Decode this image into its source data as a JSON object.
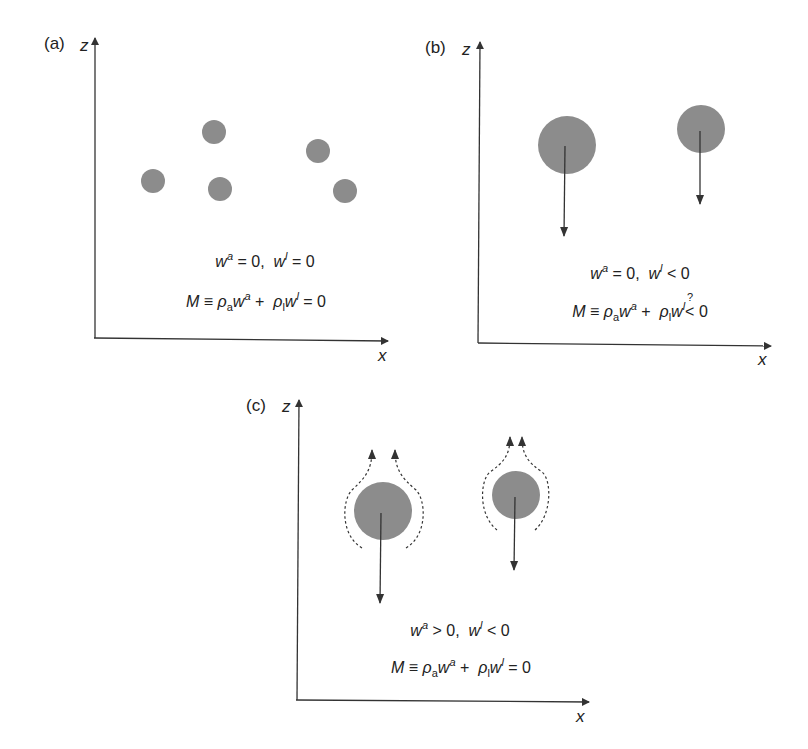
{
  "panels": [
    {
      "label": "(a)",
      "z_axis": "z",
      "x_axis": "x",
      "eq1": {
        "wa": "w",
        "wa_sup": "a",
        "wa_rel": " = 0,  ",
        "wl": "w",
        "wl_sup": "l",
        "wl_rel": " = 0"
      },
      "eq2": {
        "M": "M",
        "equiv": " ≡ ",
        "rho_a": "ρ",
        "sub_a": "a",
        "w_a": "w",
        "sup_a": "a",
        "plus": " +  ",
        "rho_l": "ρ",
        "sub_l": "l",
        "w_l": "w",
        "sup_l": "l",
        "rel": " = 0",
        "question": ""
      }
    },
    {
      "label": "(b)",
      "z_axis": "z",
      "x_axis": "x",
      "eq1": {
        "wa": "w",
        "wa_sup": "a",
        "wa_rel": " = 0,  ",
        "wl": "w",
        "wl_sup": "l",
        "wl_rel": " < 0"
      },
      "eq2": {
        "M": "M",
        "equiv": " ≡ ",
        "rho_a": "ρ",
        "sub_a": "a",
        "w_a": "w",
        "sup_a": "a",
        "plus": " +  ",
        "rho_l": "ρ",
        "sub_l": "l",
        "w_l": "w",
        "sup_l": "l",
        "rel": "< 0",
        "question": "?"
      }
    },
    {
      "label": "(c)",
      "z_axis": "z",
      "x_axis": "x",
      "eq1": {
        "wa": "w",
        "wa_sup": "a",
        "wa_rel": " > 0,  ",
        "wl": "w",
        "wl_sup": "l",
        "wl_rel": " < 0"
      },
      "eq2": {
        "M": "M",
        "equiv": " ≡ ",
        "rho_a": "ρ",
        "sub_a": "a",
        "w_a": "w",
        "sup_a": "a",
        "plus": " +  ",
        "rho_l": "ρ",
        "sub_l": "l",
        "w_l": "w",
        "sup_l": "l",
        "rel": " = 0",
        "question": ""
      }
    }
  ],
  "colors": {
    "particle": "#8c8c8c",
    "line": "#333333"
  }
}
